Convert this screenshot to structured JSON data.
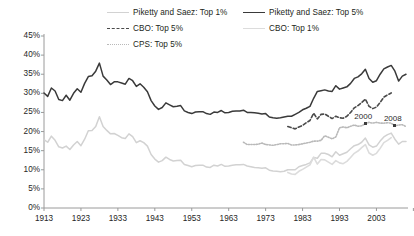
{
  "chart_data": {
    "type": "line",
    "title": "",
    "subtitle": "",
    "xlabel": "",
    "ylabel": "",
    "xlim": [
      1913,
      2011
    ],
    "ylim": [
      0,
      45
    ],
    "ytick_labels": [
      "45%",
      "40%",
      "35%",
      "30%",
      "25%",
      "20%",
      "15%",
      "10%",
      "5%",
      "0%"
    ],
    "ytick_values": [
      45,
      40,
      35,
      30,
      25,
      20,
      15,
      10,
      5,
      0
    ],
    "xtick_labels": [
      "1913",
      "1923",
      "1933",
      "1943",
      "1953",
      "1963",
      "1973",
      "1983",
      "1993",
      "2003"
    ],
    "xtick_values": [
      1913,
      1923,
      1933,
      1943,
      1953,
      1963,
      1973,
      1983,
      1993,
      2003
    ],
    "grid": false,
    "legend_position": "top",
    "legend": [
      {
        "label": "Piketty and Saez: Top 1%",
        "color": "#d2d2d2",
        "style": "solid"
      },
      {
        "label": "CBO: Top 5%",
        "color": "#4a4a4a",
        "style": "dashed"
      },
      {
        "label": "CPS: Top 5%",
        "color": "#b9b9b9",
        "style": "dotted"
      },
      {
        "label": "Piketty and Saez: Top 5%",
        "color": "#3a3a3a",
        "style": "solid"
      },
      {
        "label": "CBO: Top 1%",
        "color": "#dcdcdc",
        "style": "solid"
      }
    ],
    "annotations": [
      {
        "text": "2000",
        "x": 2000,
        "y": 22.0
      },
      {
        "text": "2008",
        "x": 2008,
        "y": 23.5
      }
    ],
    "series": [
      {
        "name": "Piketty and Saez: Top 5%",
        "color": "#3a3a3a",
        "style": "solid",
        "width": 1.5,
        "x": [
          1913,
          1914,
          1915,
          1916,
          1917,
          1918,
          1919,
          1920,
          1921,
          1922,
          1923,
          1924,
          1925,
          1926,
          1927,
          1928,
          1929,
          1930,
          1931,
          1932,
          1933,
          1934,
          1935,
          1936,
          1937,
          1938,
          1939,
          1940,
          1941,
          1942,
          1943,
          1944,
          1945,
          1946,
          1947,
          1948,
          1949,
          1950,
          1951,
          1952,
          1953,
          1954,
          1955,
          1956,
          1957,
          1958,
          1959,
          1960,
          1961,
          1962,
          1963,
          1964,
          1965,
          1966,
          1967,
          1968,
          1969,
          1970,
          1971,
          1972,
          1973,
          1974,
          1975,
          1976,
          1977,
          1978,
          1979,
          1980,
          1981,
          1982,
          1983,
          1984,
          1985,
          1986,
          1987,
          1988,
          1989,
          1990,
          1991,
          1992,
          1993,
          1994,
          1995,
          1996,
          1997,
          1998,
          1999,
          2000,
          2001,
          2002,
          2003,
          2004,
          2005,
          2006,
          2007,
          2008,
          2009,
          2010,
          2011
        ],
        "y": [
          30.1,
          29.2,
          31.4,
          30.6,
          28.4,
          28.1,
          29.5,
          28.2,
          30.0,
          31.2,
          30.3,
          32.6,
          34.4,
          34.6,
          35.8,
          37.9,
          34.5,
          33.5,
          32.3,
          33.0,
          33.0,
          32.7,
          32.4,
          33.9,
          33.3,
          31.8,
          32.5,
          31.6,
          30.4,
          28.1,
          26.7,
          25.8,
          26.3,
          27.5,
          27.0,
          26.5,
          26.6,
          26.8,
          25.4,
          25.0,
          24.7,
          25.1,
          25.2,
          25.2,
          24.7,
          24.5,
          25.1,
          25.0,
          25.5,
          24.9,
          25.0,
          25.3,
          25.4,
          25.4,
          25.6,
          25.0,
          25.0,
          24.9,
          24.8,
          24.6,
          24.7,
          23.8,
          23.6,
          23.5,
          23.6,
          23.8,
          24.0,
          24.0,
          24.5,
          25.0,
          25.7,
          26.1,
          26.6,
          28.7,
          30.5,
          30.7,
          30.9,
          30.6,
          30.5,
          32.0,
          31.1,
          31.4,
          31.7,
          32.6,
          33.9,
          34.3,
          35.1,
          36.3,
          33.9,
          32.9,
          33.3,
          35.0,
          36.4,
          36.9,
          37.3,
          35.8,
          33.2,
          34.5,
          35.0
        ]
      },
      {
        "name": "Piketty and Saez: Top 1%",
        "color": "#d2d2d2",
        "style": "solid",
        "width": 1.5,
        "x": [
          1913,
          1914,
          1915,
          1916,
          1917,
          1918,
          1919,
          1920,
          1921,
          1922,
          1923,
          1924,
          1925,
          1926,
          1927,
          1928,
          1929,
          1930,
          1931,
          1932,
          1933,
          1934,
          1935,
          1936,
          1937,
          1938,
          1939,
          1940,
          1941,
          1942,
          1943,
          1944,
          1945,
          1946,
          1947,
          1948,
          1949,
          1950,
          1951,
          1952,
          1953,
          1954,
          1955,
          1956,
          1957,
          1958,
          1959,
          1960,
          1961,
          1962,
          1963,
          1964,
          1965,
          1966,
          1967,
          1968,
          1969,
          1970,
          1971,
          1972,
          1973,
          1974,
          1975,
          1976,
          1977,
          1978,
          1979,
          1980,
          1981,
          1982,
          1983,
          1984,
          1985,
          1986,
          1987,
          1988,
          1989,
          1990,
          1991,
          1992,
          1993,
          1994,
          1995,
          1996,
          1997,
          1998,
          1999,
          2000,
          2001,
          2002,
          2003,
          2004,
          2005,
          2006,
          2007,
          2008,
          2009,
          2010,
          2011
        ],
        "y": [
          17.9,
          17.2,
          18.8,
          17.7,
          16.0,
          15.7,
          16.2,
          15.3,
          16.5,
          17.4,
          16.3,
          18.0,
          20.2,
          20.3,
          21.3,
          23.9,
          21.3,
          20.3,
          19.4,
          19.5,
          19.0,
          18.4,
          18.2,
          19.4,
          18.7,
          17.1,
          17.6,
          17.1,
          16.2,
          14.0,
          12.8,
          12.0,
          12.4,
          13.3,
          12.7,
          12.3,
          12.4,
          12.5,
          11.4,
          11.1,
          10.8,
          11.1,
          11.2,
          11.2,
          10.7,
          10.6,
          11.2,
          11.0,
          11.4,
          10.9,
          11.0,
          11.2,
          11.3,
          11.3,
          11.4,
          11.0,
          10.8,
          10.6,
          10.5,
          10.4,
          10.5,
          9.9,
          9.7,
          9.6,
          9.5,
          9.6,
          10.0,
          10.0,
          10.0,
          10.8,
          11.1,
          11.4,
          11.8,
          13.2,
          13.0,
          14.3,
          14.3,
          14.0,
          13.4,
          14.7,
          13.8,
          14.2,
          14.6,
          15.5,
          16.3,
          16.6,
          17.2,
          18.3,
          16.5,
          15.9,
          16.2,
          17.5,
          18.6,
          19.2,
          19.6,
          18.0,
          16.7,
          17.4,
          17.4
        ]
      },
      {
        "name": "CBO: Top 5%",
        "color": "#4a4a4a",
        "style": "dashed",
        "width": 1.6,
        "x": [
          1979,
          1980,
          1981,
          1982,
          1983,
          1984,
          1985,
          1986,
          1987,
          1988,
          1989,
          1990,
          1991,
          1992,
          1993,
          1994,
          1995,
          1996,
          1997,
          1998,
          1999,
          2000,
          2001,
          2002,
          2003,
          2004,
          2005,
          2006,
          2007
        ],
        "y": [
          21.3,
          21.0,
          20.7,
          21.2,
          21.6,
          22.3,
          22.9,
          24.8,
          23.3,
          24.5,
          24.6,
          24.0,
          23.4,
          24.0,
          23.6,
          23.5,
          24.0,
          25.0,
          26.2,
          26.8,
          27.6,
          28.5,
          26.6,
          26.0,
          26.4,
          27.6,
          29.0,
          29.6,
          30.1
        ]
      },
      {
        "name": "CBO: Top 1%",
        "color": "#dcdcdc",
        "style": "solid",
        "width": 1.6,
        "x": [
          1979,
          1980,
          1981,
          1982,
          1983,
          1984,
          1985,
          1986,
          1987,
          1988,
          1989,
          1990,
          1991,
          1992,
          1993,
          1994,
          1995,
          1996,
          1997,
          1998,
          1999,
          2000,
          2001,
          2002,
          2003,
          2004,
          2005,
          2006,
          2007
        ],
        "y": [
          9.3,
          8.9,
          8.8,
          9.6,
          10.1,
          10.7,
          11.3,
          13.3,
          11.5,
          12.7,
          12.6,
          12.0,
          11.4,
          12.4,
          11.8,
          11.6,
          12.2,
          13.2,
          14.3,
          14.9,
          15.8,
          16.6,
          14.4,
          13.8,
          14.3,
          15.6,
          17.1,
          17.7,
          18.4
        ]
      },
      {
        "name": "CPS: Top 5%",
        "color": "#b9b9b9",
        "style": "dotted",
        "width": 1.6,
        "x": [
          1967,
          1968,
          1969,
          1970,
          1971,
          1972,
          1973,
          1974,
          1975,
          1976,
          1977,
          1978,
          1979,
          1980,
          1981,
          1982,
          1983,
          1984,
          1985,
          1986,
          1987,
          1988,
          1989,
          1990,
          1991,
          1992,
          1993,
          1994,
          1995,
          1996,
          1997,
          1998,
          1999,
          2000,
          2001,
          2002,
          2003,
          2004,
          2005,
          2006,
          2007,
          2008,
          2009,
          2010,
          2011
        ],
        "y": [
          17.2,
          16.6,
          16.6,
          16.6,
          16.7,
          17.0,
          16.6,
          16.5,
          16.4,
          16.6,
          16.8,
          16.8,
          16.9,
          16.5,
          16.5,
          16.6,
          16.8,
          17.0,
          17.2,
          17.5,
          17.5,
          17.7,
          18.9,
          18.5,
          18.1,
          18.6,
          21.0,
          21.2,
          21.0,
          21.4,
          21.7,
          21.4,
          21.5,
          22.1,
          22.4,
          22.2,
          22.4,
          22.2,
          22.2,
          22.3,
          22.2,
          21.5,
          21.7,
          21.8,
          21.3
        ]
      }
    ]
  },
  "axes": {
    "y_title": "",
    "x_title": ""
  }
}
